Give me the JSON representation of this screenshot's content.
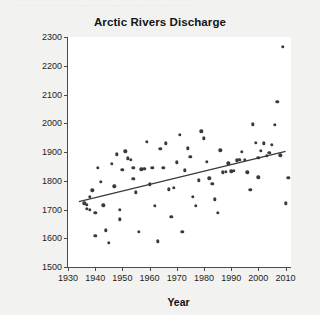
{
  "top_strip_text": "·  ···   ·· ···   ·· ···· ·· ··· ···· · ···· ···· ··· ·· ····· ··· ··",
  "chart_data": {
    "type": "scatter",
    "title": "Arctic Rivers Discharge",
    "xlabel": "Year",
    "ylabel": "Water Discharge (cubic km)",
    "xlim": [
      1930,
      2012
    ],
    "ylim": [
      1500,
      2300
    ],
    "xticks": [
      1930,
      1940,
      1950,
      1960,
      1970,
      1980,
      1990,
      2000,
      2010
    ],
    "yticks": [
      1500,
      1600,
      1700,
      1800,
      1900,
      2000,
      2100,
      2200,
      2300
    ],
    "grid": false,
    "legend": null,
    "marker": "filled-circle",
    "marker_color": "#3a3a3a",
    "points": [
      [
        1936,
        1722
      ],
      [
        1937,
        1716
      ],
      [
        1937,
        1702
      ],
      [
        1938,
        1700
      ],
      [
        1938,
        1745
      ],
      [
        1939,
        1767
      ],
      [
        1940,
        1688
      ],
      [
        1940,
        1609
      ],
      [
        1941,
        1845
      ],
      [
        1942,
        1797
      ],
      [
        1943,
        1715
      ],
      [
        1944,
        1628
      ],
      [
        1945,
        1585
      ],
      [
        1946,
        1860
      ],
      [
        1947,
        1781
      ],
      [
        1948,
        1892
      ],
      [
        1949,
        1700
      ],
      [
        1949,
        1666
      ],
      [
        1950,
        1839
      ],
      [
        1951,
        1902
      ],
      [
        1952,
        1878
      ],
      [
        1953,
        1872
      ],
      [
        1954,
        1845
      ],
      [
        1954,
        1806
      ],
      [
        1955,
        1760
      ],
      [
        1956,
        1622
      ],
      [
        1957,
        1840
      ],
      [
        1958,
        1842
      ],
      [
        1959,
        1936
      ],
      [
        1960,
        1787
      ],
      [
        1961,
        1845
      ],
      [
        1962,
        1713
      ],
      [
        1963,
        1590
      ],
      [
        1964,
        1912
      ],
      [
        1965,
        1846
      ],
      [
        1966,
        1930
      ],
      [
        1967,
        1770
      ],
      [
        1968,
        1674
      ],
      [
        1969,
        1775
      ],
      [
        1970,
        1864
      ],
      [
        1971,
        1959
      ],
      [
        1972,
        1623
      ],
      [
        1973,
        1836
      ],
      [
        1974,
        1913
      ],
      [
        1975,
        1884
      ],
      [
        1976,
        1744
      ],
      [
        1977,
        1713
      ],
      [
        1978,
        1801
      ],
      [
        1979,
        1972
      ],
      [
        1980,
        1947
      ],
      [
        1981,
        1866
      ],
      [
        1982,
        1808
      ],
      [
        1983,
        1789
      ],
      [
        1984,
        1736
      ],
      [
        1985,
        1689
      ],
      [
        1986,
        1906
      ],
      [
        1987,
        1830
      ],
      [
        1988,
        1832
      ],
      [
        1989,
        1861
      ],
      [
        1990,
        1833
      ],
      [
        1991,
        1835
      ],
      [
        1992,
        1871
      ],
      [
        1993,
        1873
      ],
      [
        1994,
        1900
      ],
      [
        1995,
        1872
      ],
      [
        1996,
        1830
      ],
      [
        1997,
        1768
      ],
      [
        1998,
        1997
      ],
      [
        1999,
        1933
      ],
      [
        2000,
        1879
      ],
      [
        2000,
        1812
      ],
      [
        2001,
        1904
      ],
      [
        2002,
        1930
      ],
      [
        2003,
        1887
      ],
      [
        2004,
        1897
      ],
      [
        2005,
        1925
      ],
      [
        2006,
        1995
      ],
      [
        2007,
        2074
      ],
      [
        2008,
        1888
      ],
      [
        2009,
        2265
      ],
      [
        2010,
        1721
      ],
      [
        2011,
        1810
      ]
    ],
    "trend_line": {
      "label": "linear-fit",
      "x_start": 1934,
      "y_start": 1727,
      "x_end": 2010,
      "y_end": 1902,
      "color": "#3a3a3a"
    }
  }
}
